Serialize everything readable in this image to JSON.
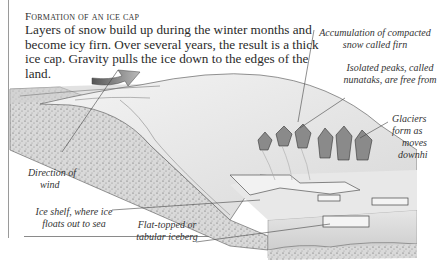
{
  "diagram": {
    "title": "Formation of an ice cap",
    "body": "Layers of snow build up during the winter months and become icy firn. Over several years, the result is a thick ice cap. Gravity pulls the ice down to the edges of the land.",
    "labels": {
      "firn": [
        "Accumulation of compacted",
        "snow called firn"
      ],
      "nunataks": [
        "Isolated peaks, called",
        "nunataks, are free from"
      ],
      "glaciers": [
        "Glaciers",
        "form as",
        "moves",
        "downhi"
      ],
      "wind": [
        "Direction of",
        "wind"
      ],
      "ice_shelf": [
        "Ice shelf, where ice",
        "floats out to sea"
      ],
      "iceberg": [
        "Flat-topped or",
        "tabular iceberg"
      ]
    },
    "icons": {
      "wind_arrow": "curved-arrow-icon"
    }
  }
}
